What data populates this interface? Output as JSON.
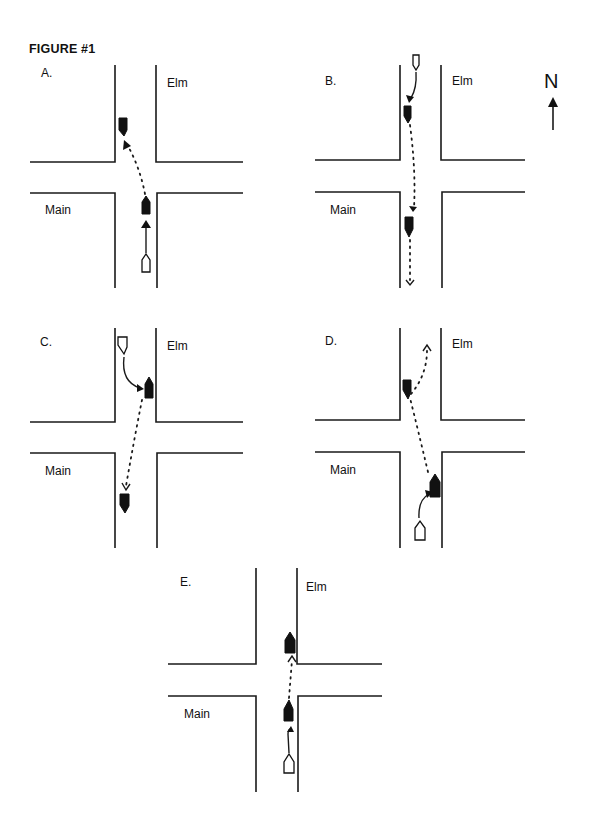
{
  "figure": {
    "title": "FIGURE #1"
  },
  "compass": {
    "label": "N",
    "icon": "north-arrow-icon"
  },
  "panels": [
    {
      "id": "A",
      "label": "A.",
      "streets": {
        "vertical": "Elm",
        "horizontal": "Main"
      },
      "description": "Open vehicle northbound on Elm from south; filled vehicle proceeds north through intersection, dotted path veers to northwest corner where a filled vehicle sits facing south."
    },
    {
      "id": "B",
      "label": "B.",
      "streets": {
        "vertical": "Elm",
        "horizontal": "Main"
      },
      "description": "Open vehicle southbound from north edge curves to filled vehicle at northwest corner; dotted path continues south through intersection to filled vehicle and exits south."
    },
    {
      "id": "C",
      "label": "C.",
      "streets": {
        "vertical": "Elm",
        "horizontal": "Main"
      },
      "description": "Open vehicle from north curves to filled vehicle at northeast side facing north; dotted path continues south-southwest to filled vehicle south of intersection facing south."
    },
    {
      "id": "D",
      "label": "D.",
      "streets": {
        "vertical": "Elm",
        "horizontal": "Main"
      },
      "description": "Open vehicle from south curves to filled vehicle at southeast corner facing north; dotted path runs north-northwest to filled vehicle at northwest corner facing south, then dotted path curves northeast exiting north."
    },
    {
      "id": "E",
      "label": "E.",
      "streets": {
        "vertical": "Elm",
        "horizontal": "Main"
      },
      "description": "Open vehicle from south; arrow to filled vehicle south of intersection facing north; dotted path continues north to filled vehicle at northeast corner facing north."
    }
  ],
  "legend_colors": {
    "line": "#1a1a1a",
    "vehicle_filled": "#111111",
    "vehicle_open": "#ffffff",
    "background": "#ffffff"
  }
}
